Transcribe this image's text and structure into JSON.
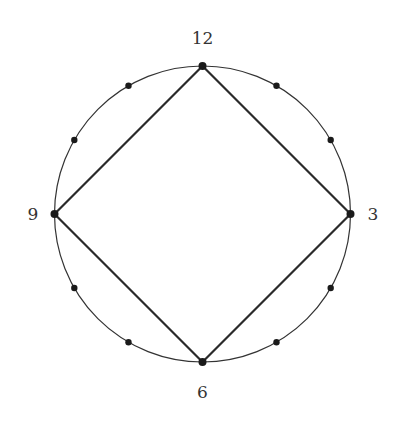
{
  "diagram": {
    "type": "clock-face with inscribed square",
    "circle": {
      "cx": 202.5,
      "cy": 214,
      "r": 148,
      "stroke": "#333333"
    },
    "hour_marks": 12,
    "labels": {
      "twelve": "12",
      "three": "3",
      "six": "6",
      "nine": "9"
    },
    "square_vertices": [
      "12",
      "3",
      "6",
      "9"
    ],
    "colors": {
      "line": "#2a2a2a",
      "dot": "#1a1a1a",
      "background": "#ffffff"
    }
  }
}
